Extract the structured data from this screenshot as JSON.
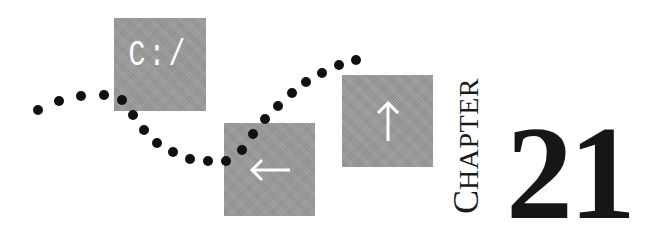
{
  "boxes": {
    "drive": {
      "label": "C:/",
      "icon": "drive-path-label"
    },
    "left": {
      "icon": "arrow-left-icon",
      "glyph": "←"
    },
    "up": {
      "icon": "arrow-up-icon",
      "glyph": "↑"
    }
  },
  "chapter": {
    "word_initial": "C",
    "word_rest": "HAPTER",
    "number": "21"
  },
  "colors": {
    "box_gray": "#9c9c9c",
    "dot": "#111111",
    "text": "#161616",
    "icon": "#ffffff"
  }
}
